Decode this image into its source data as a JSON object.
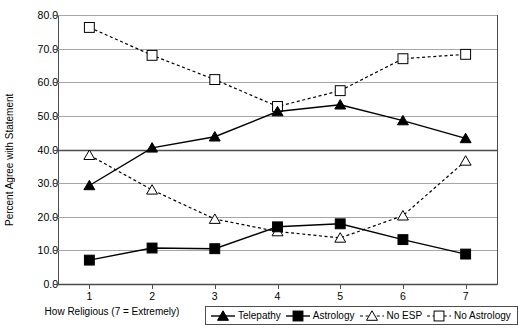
{
  "chart_data": {
    "type": "line",
    "title": "",
    "xlabel": "How Religious (7 = Extremely)",
    "ylabel": "Percent Agree with Statement",
    "categories": [
      "1",
      "2",
      "3",
      "4",
      "5",
      "6",
      "7"
    ],
    "x": [
      1,
      2,
      3,
      4,
      5,
      6,
      7
    ],
    "xlim": [
      0.5,
      7.5
    ],
    "ylim": [
      0.0,
      80.0
    ],
    "yticks": [
      "0.0",
      "10.0",
      "20.0",
      "30.0",
      "40.0",
      "50.0",
      "60.0",
      "70.0",
      "80.0"
    ],
    "ytick_values": [
      0,
      10,
      20,
      30,
      40,
      50,
      60,
      70,
      80
    ],
    "grid": true,
    "legend_position": "bottom-right",
    "series": [
      {
        "name": "Telepathy",
        "marker": "filled-triangle",
        "line": "solid",
        "color": "#000000",
        "values": [
          29.3,
          40.5,
          43.8,
          51.3,
          53.3,
          48.6,
          43.3
        ]
      },
      {
        "name": "Astrology",
        "marker": "filled-square",
        "line": "solid",
        "color": "#000000",
        "values": [
          7.1,
          10.7,
          10.5,
          17.0,
          17.9,
          13.2,
          8.9
        ]
      },
      {
        "name": "No ESP",
        "marker": "open-triangle",
        "line": "dashed",
        "color": "#000000",
        "values": [
          38.3,
          28.0,
          19.3,
          15.6,
          13.7,
          20.3,
          36.6
        ]
      },
      {
        "name": "No Astrology",
        "marker": "open-square",
        "line": "dashed",
        "color": "#000000",
        "values": [
          76.3,
          68.0,
          60.8,
          52.8,
          57.5,
          67.0,
          68.3
        ]
      }
    ]
  },
  "legend": {
    "items": [
      {
        "label": "Telepathy"
      },
      {
        "label": "Astrology"
      },
      {
        "label": "No ESP"
      },
      {
        "label": "No Astrology"
      }
    ]
  }
}
